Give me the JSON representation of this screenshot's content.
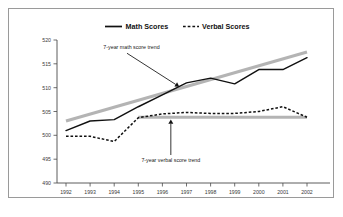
{
  "chart_data": {
    "type": "line",
    "title": "",
    "xlabel": "",
    "ylabel": "",
    "categories": [
      "1992",
      "1993",
      "1994",
      "1995",
      "1996",
      "1997",
      "1998",
      "1999",
      "2000",
      "2001",
      "2002"
    ],
    "x": [
      1992,
      1993,
      1994,
      1995,
      1996,
      1997,
      1998,
      1999,
      2000,
      2001,
      2002
    ],
    "ylim": [
      490,
      520
    ],
    "xlim": [
      1992,
      2002
    ],
    "yticks": [
      490,
      495,
      500,
      505,
      510,
      515,
      520
    ],
    "ytick_labels": [
      "490",
      "495",
      "500",
      "505",
      "510",
      "515",
      "520"
    ],
    "grid": false,
    "legend_position": "top-center",
    "series": [
      {
        "name": "Math Scores",
        "style": "solid",
        "color": "#111111",
        "values": [
          501.0,
          503.0,
          503.3,
          506.0,
          508.5,
          511.0,
          512.0,
          510.8,
          513.8,
          513.8,
          516.3
        ]
      },
      {
        "name": "Verbal Scores",
        "style": "dashed",
        "color": "#111111",
        "values": [
          499.8,
          499.8,
          498.7,
          503.7,
          504.5,
          504.8,
          504.6,
          504.6,
          505.0,
          506.0,
          503.8
        ]
      }
    ],
    "trend_lines": [
      {
        "name": "7-year math score trend",
        "color": "#b4b4b4",
        "x_start": 1992,
        "x_end": 2002,
        "y_start": 503.0,
        "y_end": 517.5
      },
      {
        "name": "7-year verbal score trend",
        "color": "#b4b4b4",
        "x_start": 1995,
        "x_end": 2002,
        "y_start": 503.8,
        "y_end": 503.8
      }
    ],
    "annotations": [
      {
        "text": "7-year math score trend",
        "text_x": 1993.55,
        "text_y": 518.1,
        "target_x": 1996.7,
        "target_y": 510.2
      },
      {
        "text": "7-year verbal score trend",
        "text_x": 1996.35,
        "text_y": 494.4,
        "target_x": 1996.35,
        "target_y": 503.3
      }
    ],
    "legend": [
      {
        "label": "Math Scores",
        "style": "solid"
      },
      {
        "label": "Verbal Scores",
        "style": "dashed"
      }
    ]
  }
}
